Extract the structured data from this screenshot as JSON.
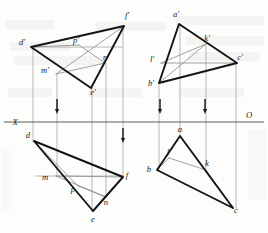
{
  "figure": {
    "ground_line": {
      "left_label": "X",
      "right_label": "O",
      "y": 122,
      "x_start": 4,
      "x_end": 264
    },
    "stroke_colors": {
      "outline": "#1a1a1a",
      "thin": "#8d8d8d",
      "axis": "#6f6f6f",
      "auxiliary": "#a9a9a9",
      "paper": "#fdfdfb"
    }
  },
  "projections": [
    {
      "id": "left-front-view",
      "name": "Front view of triangle DEF with line MNP",
      "vertices": [
        {
          "label": "d'",
          "x": 31,
          "y": 47,
          "lx": 22,
          "ly": 45
        },
        {
          "label": "f'",
          "x": 124,
          "y": 26,
          "lx": 127,
          "ly": 18
        },
        {
          "label": "e'",
          "x": 91,
          "y": 88,
          "lx": 93,
          "ly": 95
        }
      ],
      "line_points": [
        {
          "label": "m'",
          "x": 56,
          "y": 74,
          "lx": 45,
          "ly": 73
        },
        {
          "label": "n'",
          "x": 105,
          "y": 63,
          "lx": 106,
          "ly": 60
        },
        {
          "label": "p'",
          "x": 79,
          "y": 45,
          "lx": 76,
          "ly": 43
        }
      ]
    },
    {
      "id": "left-top-view",
      "name": "Top view of triangle DEF with line MNP",
      "vertices": [
        {
          "label": "d",
          "x": 34,
          "y": 141,
          "lx": 28,
          "ly": 138
        },
        {
          "label": "f",
          "x": 123,
          "y": 177,
          "lx": 127,
          "ly": 178
        },
        {
          "label": "e",
          "x": 93,
          "y": 211,
          "lx": 93,
          "ly": 222
        }
      ],
      "line_points": [
        {
          "label": "m",
          "x": 56,
          "y": 176,
          "lx": 45,
          "ly": 180
        },
        {
          "label": "n",
          "x": 106,
          "y": 197,
          "lx": 106,
          "ly": 205
        },
        {
          "label": "p",
          "x": 78,
          "y": 186,
          "lx": 73,
          "ly": 192
        }
      ]
    },
    {
      "id": "right-front-view",
      "name": "Front view of triangle ABC with line KL",
      "vertices": [
        {
          "label": "a'",
          "x": 179,
          "y": 24,
          "lx": 176,
          "ly": 17
        },
        {
          "label": "c'",
          "x": 237,
          "y": 63,
          "lx": 240,
          "ly": 60
        },
        {
          "label": "b'",
          "x": 159,
          "y": 83,
          "lx": 151,
          "ly": 86
        }
      ],
      "line_points": [
        {
          "label": "k'",
          "x": 206,
          "y": 44,
          "lx": 207,
          "ly": 41
        },
        {
          "label": "l'",
          "x": 161,
          "y": 63,
          "lx": 152,
          "ly": 62
        }
      ]
    },
    {
      "id": "right-top-view",
      "name": "Top view of triangle ABC with line KL",
      "vertices": [
        {
          "label": "a",
          "x": 180,
          "y": 136,
          "lx": 180,
          "ly": 132
        },
        {
          "label": "b",
          "x": 157,
          "y": 170,
          "lx": 149,
          "ly": 172
        },
        {
          "label": "c",
          "x": 233,
          "y": 208,
          "lx": 236,
          "ly": 213
        }
      ],
      "line_points": [
        {
          "label": "k",
          "x": 206,
          "y": 170,
          "lx": 207,
          "ly": 166
        },
        {
          "label": "l",
          "x": 169,
          "y": 158,
          "lx": 168,
          "ly": 155
        }
      ]
    }
  ],
  "connector_lines": [
    {
      "name": "connector-d",
      "x": 33,
      "y1": 47,
      "y2": 143
    },
    {
      "name": "connector-m",
      "x": 57,
      "y1": 74,
      "y2": 177
    },
    {
      "name": "connector-e",
      "x": 92,
      "y1": 88,
      "y2": 212
    },
    {
      "name": "connector-n",
      "x": 106,
      "y1": 63,
      "y2": 198
    },
    {
      "name": "connector-f",
      "x": 123,
      "y1": 26,
      "y2": 178
    },
    {
      "name": "connector-b",
      "x": 159,
      "y1": 83,
      "y2": 171
    },
    {
      "name": "connector-a",
      "x": 180,
      "y1": 24,
      "y2": 137
    },
    {
      "name": "connector-k",
      "x": 206,
      "y1": 44,
      "y2": 171
    },
    {
      "name": "connector-c",
      "x": 236,
      "y1": 63,
      "y2": 209
    }
  ],
  "horizontal_guides": [
    {
      "name": "guide-dn-front",
      "x1": 33,
      "x2": 123,
      "y": 47
    },
    {
      "name": "guide-mp-top",
      "x1": 35,
      "x2": 123,
      "y": 176
    }
  ],
  "direction_arrows": [
    {
      "name": "arrow-left-upper",
      "x": 57,
      "y_top": 99,
      "y_tip": 114
    },
    {
      "name": "arrow-left-lower",
      "x": 123,
      "y_top": 128,
      "y_tip": 143
    },
    {
      "name": "arrow-right-inner",
      "x": 160,
      "y_top": 99,
      "y_tip": 114
    },
    {
      "name": "arrow-right-outer",
      "x": 205,
      "y_top": 99,
      "y_tip": 114
    }
  ],
  "background_text": {
    "note": "faint printed text bleeding through from reverse side of page",
    "blocks": [
      {
        "text": "全部",
        "x": 108,
        "y": 30
      },
      {
        "text": "题",
        "x": 250,
        "y": 22
      },
      {
        "text": "面的",
        "x": 30,
        "y": 48
      },
      {
        "text": "点和直线",
        "x": 196,
        "y": 42
      },
      {
        "text": "相交",
        "x": 40,
        "y": 60
      },
      {
        "text": "投影图",
        "x": 196,
        "y": 58
      },
      {
        "text": "求作",
        "x": 24,
        "y": 96
      },
      {
        "text": "交点",
        "x": 96,
        "y": 96
      },
      {
        "text": "可见性",
        "x": 186,
        "y": 96
      }
    ]
  }
}
